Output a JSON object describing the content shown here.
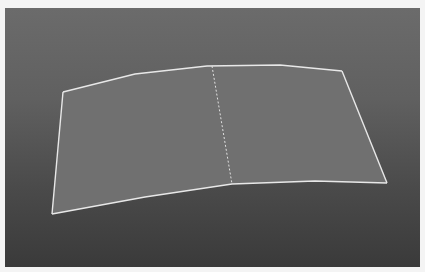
{
  "viewport": {
    "name": "3D perspective viewport",
    "background_top": "#6b6b6b",
    "background_bottom": "#3a3a3a"
  },
  "surface": {
    "name": "curved plane surface",
    "fill": "#707070",
    "edge_color": "#e8e8e8",
    "center_edge_color": "#e0e0e0",
    "top_edge_points": "58,84 130,66 202,58 275,57 337,63",
    "right_edge_points": "337,63 382,175",
    "bottom_edge_points": "382,175 310,173 227,176 140,189 47,206",
    "left_edge_points": "47,206 58,84",
    "outline_points": "58,84 130,66 202,58 275,57 337,63 382,175 310,173 227,176 140,189 47,206",
    "center_edge": {
      "x1": 207,
      "y1": 58,
      "x2": 227,
      "y2": 176
    }
  }
}
